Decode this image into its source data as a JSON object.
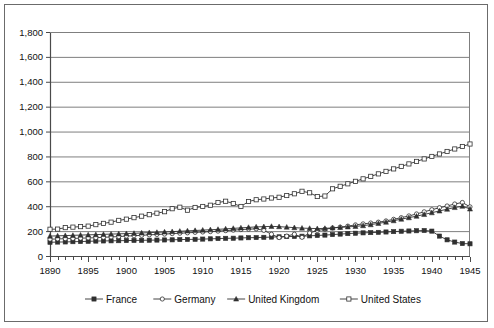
{
  "chart_data": {
    "type": "line",
    "title": "",
    "subtitle": "",
    "xlabel": "",
    "ylabel": "",
    "xlim": [
      1890,
      1945
    ],
    "ylim": [
      0,
      1800
    ],
    "ytick_step": 200,
    "xtick_label_step": 5,
    "xtick_minor_step": 1,
    "grid": "horizontal",
    "legend_position": "bottom",
    "ytick_labels": [
      "0",
      "200",
      "400",
      "600",
      "800",
      "1,000",
      "1,200",
      "1,400",
      "1,600",
      "1,800"
    ],
    "ytick_values": [
      0,
      200,
      400,
      600,
      800,
      1000,
      1200,
      1400,
      1600,
      1800
    ],
    "xtick_labels": [
      "1890",
      "1895",
      "1900",
      "1905",
      "1910",
      "1915",
      "1920",
      "1925",
      "1930",
      "1935",
      "1940",
      "1945"
    ],
    "xtick_values": [
      1890,
      1895,
      1900,
      1905,
      1910,
      1915,
      1920,
      1925,
      1930,
      1935,
      1940,
      1945
    ],
    "x": [
      1890,
      1891,
      1892,
      1893,
      1894,
      1895,
      1896,
      1897,
      1898,
      1899,
      1900,
      1901,
      1902,
      1903,
      1904,
      1905,
      1906,
      1907,
      1908,
      1909,
      1910,
      1911,
      1912,
      1913,
      1914,
      1915,
      1916,
      1917,
      1918,
      1919,
      1920,
      1921,
      1922,
      1923,
      1924,
      1925,
      1926,
      1927,
      1928,
      1929,
      1930,
      1931,
      1932,
      1933,
      1934,
      1935,
      1936,
      1937,
      1938,
      1939,
      1940,
      1941,
      1942,
      1943,
      1944,
      1945
    ],
    "series": [
      {
        "name": "France",
        "marker": "filled-square",
        "values": [
          110,
          112,
          113,
          115,
          116,
          118,
          120,
          121,
          122,
          123,
          124,
          125,
          126,
          127,
          128,
          129,
          130,
          132,
          133,
          134,
          136,
          138,
          140,
          142,
          143,
          145,
          147,
          148,
          150,
          152,
          154,
          156,
          157,
          159,
          162,
          165,
          168,
          172,
          176,
          180,
          183,
          186,
          188,
          190,
          193,
          196,
          199,
          201,
          203,
          205,
          200,
          160,
          130,
          112,
          100,
          98
        ]
      },
      {
        "name": "Germany",
        "marker": "open-circle",
        "values": [
          135,
          137,
          139,
          141,
          143,
          145,
          147,
          150,
          153,
          156,
          160,
          163,
          166,
          170,
          173,
          176,
          180,
          183,
          186,
          190,
          193,
          196,
          200,
          204,
          208,
          212,
          216,
          218,
          206,
          175,
          148,
          160,
          175,
          150,
          185,
          205,
          215,
          225,
          232,
          240,
          250,
          258,
          265,
          272,
          282,
          295,
          308,
          322,
          338,
          355,
          372,
          388,
          402,
          418,
          430,
          395
        ]
      },
      {
        "name": "United Kingdom",
        "marker": "filled-triangle",
        "values": [
          160,
          162,
          164,
          166,
          168,
          170,
          172,
          174,
          176,
          178,
          180,
          182,
          185,
          188,
          190,
          193,
          196,
          199,
          202,
          205,
          208,
          211,
          214,
          218,
          222,
          226,
          230,
          234,
          236,
          238,
          236,
          232,
          228,
          224,
          222,
          220,
          222,
          226,
          230,
          234,
          238,
          244,
          252,
          262,
          272,
          284,
          296,
          308,
          320,
          334,
          348,
          362,
          376,
          390,
          400,
          378
        ]
      },
      {
        "name": "United States",
        "marker": "open-square",
        "values": [
          215,
          216,
          228,
          232,
          236,
          240,
          252,
          262,
          272,
          286,
          296,
          308,
          320,
          332,
          344,
          356,
          380,
          392,
          368,
          390,
          398,
          408,
          430,
          440,
          422,
          398,
          438,
          452,
          458,
          466,
          472,
          486,
          500,
          520,
          508,
          478,
          482,
          540,
          560,
          580,
          600,
          620,
          640,
          660,
          680,
          700,
          720,
          740,
          760,
          780,
          800,
          820,
          840,
          860,
          880,
          900
        ]
      }
    ],
    "series_overrides_note": "",
    "legend_entries": [
      {
        "label": "France",
        "marker": "filled-square"
      },
      {
        "label": "Germany",
        "marker": "open-circle"
      },
      {
        "label": "United Kingdom",
        "marker": "filled-triangle"
      },
      {
        "label": "United States",
        "marker": "open-square"
      }
    ],
    "us_actual": [
      215,
      216,
      228,
      232,
      236,
      240,
      252,
      262,
      272,
      286,
      296,
      308,
      320,
      332,
      344,
      356,
      380,
      392,
      368,
      390,
      398,
      408,
      430,
      440,
      422,
      398,
      438,
      452,
      458,
      466,
      472,
      486,
      500,
      520,
      508,
      478,
      482,
      540,
      560,
      580,
      600,
      620,
      640,
      660,
      680,
      700,
      720,
      740,
      760,
      780,
      800,
      820,
      840,
      860,
      880,
      900
    ],
    "colors": {
      "line": "#303030",
      "grid": "#7f7f7f",
      "axis": "#4a4a4a",
      "text": "#111111",
      "frame": "#6b6b6b",
      "background": "#ffffff"
    }
  }
}
